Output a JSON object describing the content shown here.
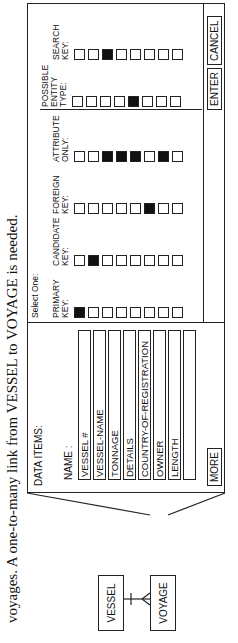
{
  "caption": "voyages. A one-to-many link from VESSEL to VOYAGE is needed.",
  "er_diagram": {
    "entities": [
      "VESSEL",
      "VOYAGE"
    ],
    "relationship": "one-to-many",
    "from": "VESSEL",
    "to": "VOYAGE"
  },
  "panel": {
    "data_items_title": "DATA ITEMS:",
    "name_label": "NAME :",
    "names": [
      "VESSEL #",
      "VESSEL-NAME",
      "TONNAGE",
      "DETAILS",
      "COUNTRY-OF-REGISTRATION",
      "OWNER",
      "LENGTH",
      ""
    ],
    "more_button": "MORE",
    "select_label": "Select One:",
    "columns": [
      {
        "label_1": "PRIMARY",
        "label_2": "KEY:",
        "label_3": "",
        "checked": [
          0
        ]
      },
      {
        "label_1": "CANDIDATE",
        "label_2": "KEY:",
        "label_3": "",
        "checked": [
          1
        ]
      },
      {
        "label_1": "FOREIGN",
        "label_2": "KEY:",
        "label_3": "",
        "checked": [
          5
        ]
      },
      {
        "label_1": "ATTRIBUTE",
        "label_2": "ONLY:",
        "label_3": "",
        "checked": [
          2,
          3,
          4,
          6
        ]
      },
      {
        "label_1": "POSSIBLE",
        "label_2": "ENTITY",
        "label_3": "TYPE:",
        "checked": [
          4
        ]
      },
      {
        "label_1": "SEARCH",
        "label_2": "KEY:",
        "label_3": "",
        "checked": [
          2
        ]
      }
    ],
    "enter_button": "ENTER",
    "cancel_button": "CANCEL"
  }
}
